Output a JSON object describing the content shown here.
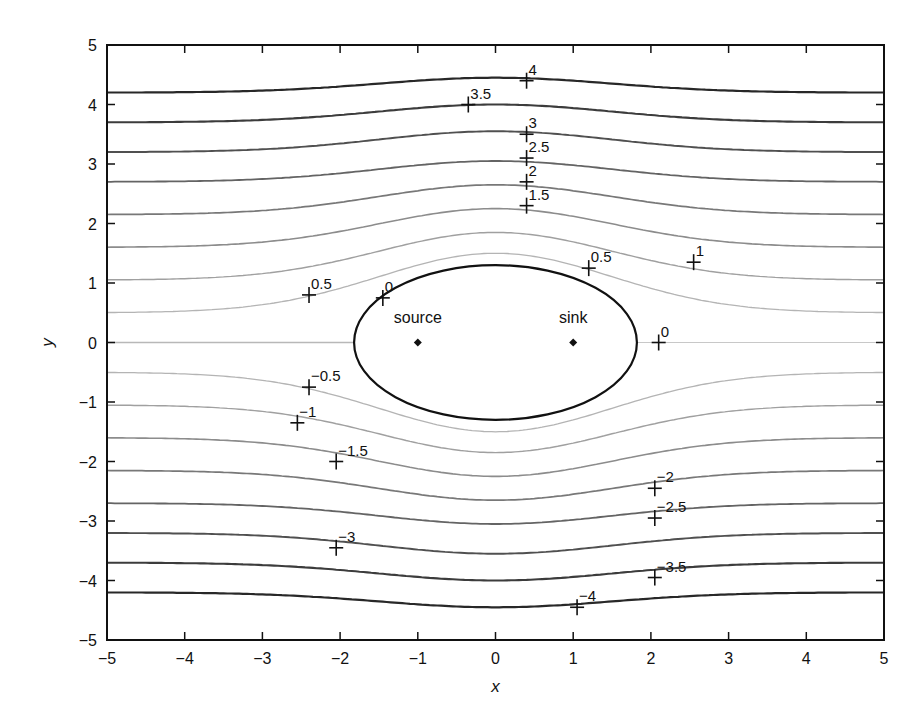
{
  "chart_data": {
    "type": "contour",
    "title": "",
    "xlabel": "x",
    "ylabel": "y",
    "xlim": [
      -5,
      5
    ],
    "ylim": [
      -5,
      5
    ],
    "grid": false,
    "legend": null,
    "x_ticks": [
      -5,
      -4,
      -3,
      -2,
      -1,
      0,
      1,
      2,
      3,
      4,
      5
    ],
    "y_ticks": [
      -5,
      -4,
      -3,
      -2,
      -1,
      0,
      1,
      2,
      3,
      4,
      5
    ],
    "x_tick_labels": [
      "−5",
      "−4",
      "−3",
      "−2",
      "−1",
      "0",
      "1",
      "2",
      "3",
      "4",
      "5"
    ],
    "y_tick_labels": [
      "−5",
      "−4",
      "−3",
      "−2",
      "−1",
      "0",
      "1",
      "2",
      "3",
      "4",
      "5"
    ],
    "contour_levels": [
      -4,
      -3.5,
      -3,
      -2.5,
      -2,
      -1.5,
      -1,
      -0.5,
      0,
      0.5,
      1,
      1.5,
      2,
      2.5,
      3,
      3.5,
      4
    ],
    "contour_far_field_y": {
      "-4": -4.2,
      "-3.5": -3.7,
      "-3": -3.2,
      "-2.5": -2.7,
      "-2": -2.15,
      "-1.5": -1.6,
      "-1": -1.05,
      "-0.5": -0.5,
      "0": 0,
      "0.5": 0.5,
      "1": 1.05,
      "1.5": 1.6,
      "2": 2.15,
      "2.5": 2.7,
      "3": 3.2,
      "3.5": 3.7,
      "4": 4.2
    },
    "contour_center_y": {
      "-4": -4.45,
      "-3.5": -4.0,
      "-3": -3.55,
      "-2.5": -3.05,
      "-2": -2.65,
      "-1.5": -2.25,
      "-1": -1.85,
      "-0.5": -1.5,
      "0.5": 1.5,
      "1": 1.85,
      "1.5": 2.25,
      "2": 2.65,
      "2.5": 3.05,
      "3": 3.55,
      "3.5": 4.0,
      "4": 4.45
    },
    "dividing_streamline": {
      "shape": "oval",
      "center": [
        0,
        0
      ],
      "half_length_x": 1.82,
      "half_height_y": 1.3
    },
    "points": [
      {
        "name": "source",
        "x": -1,
        "y": 0
      },
      {
        "name": "sink",
        "x": 1,
        "y": 0
      }
    ],
    "contour_labels": [
      {
        "text": "4",
        "x": 0.4,
        "y": 4.4
      },
      {
        "text": "3.5",
        "x": -0.35,
        "y": 4.0
      },
      {
        "text": "3",
        "x": 0.4,
        "y": 3.5
      },
      {
        "text": "2.5",
        "x": 0.4,
        "y": 3.1
      },
      {
        "text": "2",
        "x": 0.4,
        "y": 2.7
      },
      {
        "text": "1.5",
        "x": 0.4,
        "y": 2.3
      },
      {
        "text": "1",
        "x": 2.55,
        "y": 1.35
      },
      {
        "text": "0.5",
        "x": -2.4,
        "y": 0.8
      },
      {
        "text": "0",
        "x": -1.45,
        "y": 0.75
      },
      {
        "text": "0.5",
        "x": 1.2,
        "y": 1.25
      },
      {
        "text": "0",
        "x": 2.1,
        "y": 0
      },
      {
        "text": "−0.5",
        "x": -2.4,
        "y": -0.75
      },
      {
        "text": "−1",
        "x": -2.55,
        "y": -1.35
      },
      {
        "text": "−1.5",
        "x": -2.05,
        "y": -2.0
      },
      {
        "text": "−2",
        "x": 2.05,
        "y": -2.45
      },
      {
        "text": "−2.5",
        "x": 2.05,
        "y": -2.95
      },
      {
        "text": "−3",
        "x": -2.05,
        "y": -3.45
      },
      {
        "text": "−3.5",
        "x": 2.05,
        "y": -3.95
      },
      {
        "text": "−4",
        "x": 1.05,
        "y": -4.45
      }
    ]
  },
  "annotations": {
    "source_label": "source",
    "sink_label": "sink"
  }
}
